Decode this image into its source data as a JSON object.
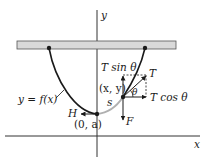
{
  "diagram": {
    "type": "hanging cable free-body diagram",
    "axes": {
      "x_label": "x",
      "y_label": "y"
    },
    "labels": {
      "curve": "y = f(x)",
      "origin_point": "(0, a)",
      "general_point": "(x, y)",
      "arc_length": "s",
      "horizontal_tension": "H",
      "tension": "T",
      "tension_vertical": "T sin θ",
      "tension_horizontal": "T cos θ",
      "angle": "θ",
      "weight": "F"
    },
    "colors": {
      "curve": "#1a1a1a",
      "arc_segment": "#b0b0b0",
      "support_bar_fill": "#d9d9d9",
      "support_bar_stroke": "#555555",
      "axes": "#333333"
    }
  }
}
